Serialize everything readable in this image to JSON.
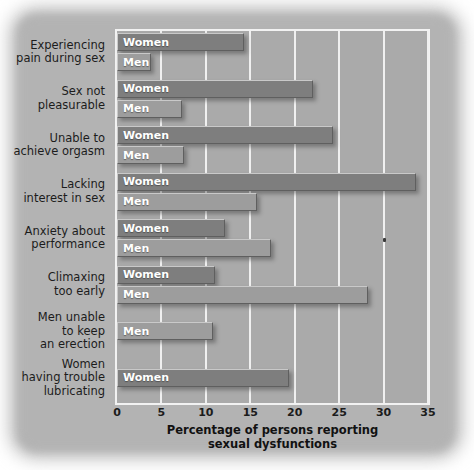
{
  "chart_data": {
    "type": "bar",
    "orientation": "horizontal",
    "title": "",
    "xlabel": "Percentage of persons reporting sexual dysfunctions",
    "ylabel": "",
    "xlim": [
      0,
      35
    ],
    "xticks": [
      0,
      5,
      10,
      15,
      20,
      25,
      30,
      35
    ],
    "grid": true,
    "legend": "inline-bar-labels",
    "series": [
      {
        "name": "Women",
        "color": "#7e7e7e"
      },
      {
        "name": "Men",
        "color": "#9d9d9d"
      }
    ],
    "categories": [
      "Experiencing pain during sex",
      "Sex not pleasurable",
      "Unable to achieve orgasm",
      "Lacking interest in sex",
      "Anxiety about performance",
      "Climaxing too early",
      "Men unable to keep an erection",
      "Women having trouble lubricating"
    ],
    "groups": [
      {
        "category_lines": [
          "Experiencing",
          "pain during sex"
        ],
        "bars": [
          {
            "series": "Women",
            "label": "Women",
            "value": 14.3
          },
          {
            "series": "Men",
            "label": "Men",
            "value": 3.1
          }
        ]
      },
      {
        "category_lines": [
          "Sex not",
          "pleasurable"
        ],
        "bars": [
          {
            "series": "Women",
            "label": "Women",
            "value": 22.1
          },
          {
            "series": "Men",
            "label": "Men",
            "value": 7.3
          }
        ]
      },
      {
        "category_lines": [
          "Unable to",
          "achieve orgasm"
        ],
        "bars": [
          {
            "series": "Women",
            "label": "Women",
            "value": 24.3
          },
          {
            "series": "Men",
            "label": "Men",
            "value": 7.5
          }
        ]
      },
      {
        "category_lines": [
          "Lacking",
          "interest in sex"
        ],
        "bars": [
          {
            "series": "Women",
            "label": "Women",
            "value": 33.6
          },
          {
            "series": "Men",
            "label": "Men",
            "value": 15.7
          }
        ]
      },
      {
        "category_lines": [
          "Anxiety about",
          "performance"
        ],
        "bars": [
          {
            "series": "Women",
            "label": "Women",
            "value": 12.1
          },
          {
            "series": "Men",
            "label": "Men",
            "value": 17.3
          }
        ]
      },
      {
        "category_lines": [
          "Climaxing",
          "too early"
        ],
        "bars": [
          {
            "series": "Women",
            "label": "Women",
            "value": 11.0
          },
          {
            "series": "Men",
            "label": "Men",
            "value": 28.2
          }
        ]
      },
      {
        "category_lines": [
          "Men unable",
          "to keep",
          "an erection"
        ],
        "bars": [
          {
            "series": "Men",
            "label": "Men",
            "value": 10.8
          }
        ]
      },
      {
        "category_lines": [
          "Women",
          "having trouble",
          "lubricating"
        ],
        "bars": [
          {
            "series": "Women",
            "label": "Women",
            "value": 19.4
          }
        ]
      }
    ]
  },
  "colors": {
    "page_background": "#ffffff",
    "panel": "#b3b3b3",
    "plot_background": "#aaaaaa",
    "gridline": "#f0f0f0",
    "women_bar": "#7e7e7e",
    "men_bar": "#9d9d9d",
    "text": "#1c1c1c",
    "bar_label_text": "#ffffff"
  }
}
